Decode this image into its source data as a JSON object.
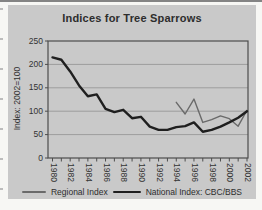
{
  "page": {
    "background": "#f7f7f4",
    "panel_background": "#c9c9c9",
    "top_edge_color": "#707070"
  },
  "chart_data": {
    "type": "line",
    "title": "Indices for Tree Sparrows",
    "ylabel": "Index: 2002=100",
    "ylim": [
      0,
      250
    ],
    "yticks": [
      0,
      50,
      100,
      150,
      200,
      250
    ],
    "xtick_labels": [
      "1980",
      "1982",
      "1984",
      "1986",
      "1988",
      "1990",
      "1992",
      "1994",
      "1996",
      "1998",
      "2000",
      "2002"
    ],
    "x_year_range": [
      1980,
      2002
    ],
    "grid": "horizontal gridlines on, vertical off",
    "legend_position": "bottom",
    "frame_color": "#4d4d4d",
    "gridline_color": "#9d9d9d",
    "tick_color": "#4d4d4d",
    "series": [
      {
        "name": "Regional Index",
        "color": "#6a6a6a",
        "stroke_width": 1.4,
        "start_year": 1994,
        "values": [
          119,
          94,
          126,
          76,
          82,
          90,
          84,
          68,
          102
        ]
      },
      {
        "name": "National Index: CBC/BBS",
        "color": "#1f1f1f",
        "stroke_width": 2.4,
        "start_year": 1980,
        "values": [
          215,
          210,
          185,
          155,
          132,
          136,
          105,
          98,
          103,
          85,
          88,
          67,
          60,
          60,
          66,
          68,
          76,
          56,
          60,
          67,
          76,
          86,
          100
        ]
      }
    ]
  }
}
